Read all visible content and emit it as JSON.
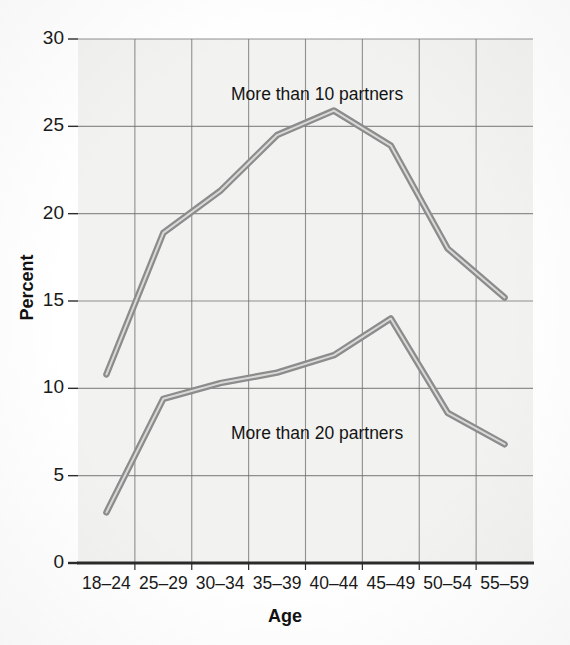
{
  "chart_data": {
    "type": "line",
    "title": "",
    "xlabel": "Age",
    "ylabel": "Percent",
    "categories": [
      "18–24",
      "25–29",
      "30–34",
      "35–39",
      "40–44",
      "45–49",
      "50–54",
      "55–59"
    ],
    "ylim": [
      0,
      30
    ],
    "yticks": [
      0,
      5,
      10,
      15,
      20,
      25,
      30
    ],
    "ytick_labels": [
      "0",
      "5",
      "10",
      "15",
      "20",
      "25",
      "30"
    ],
    "grid": true,
    "legend_position": "inline-annotation",
    "series": [
      {
        "name": "More than 10 partners",
        "values": [
          10.8,
          18.9,
          21.3,
          24.5,
          25.9,
          23.9,
          18.0,
          15.2
        ],
        "color": "#8c8c8c"
      },
      {
        "name": "More than 20 partners",
        "values": [
          2.9,
          9.4,
          10.3,
          10.9,
          11.9,
          14.0,
          8.6,
          6.8
        ],
        "color": "#8c8c8c"
      }
    ],
    "annotations": [
      {
        "text": "More than 10 partners",
        "x_px": 231,
        "y_px": 84
      },
      {
        "text": "More than 20 partners",
        "x_px": 231,
        "y_px": 423
      }
    ]
  },
  "colors": {
    "line": "#8c8c8c",
    "line_core": "#a6a6a6",
    "grid": "#6e6e6e",
    "axis": "#2b2b2b",
    "plot_bg": "#f2f2f0",
    "text": "#1a1a1a"
  }
}
